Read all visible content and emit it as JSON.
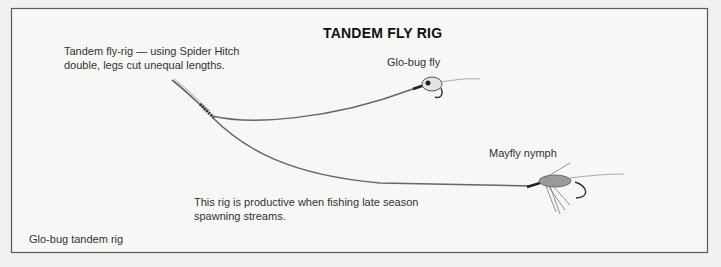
{
  "title": "TANDEM FLY RIG",
  "annotations": {
    "rig_description": [
      "Tandem fly-rig — using Spider Hitch",
      "double, legs cut unequal lengths."
    ],
    "upper_fly_label": "Glo-bug fly",
    "lower_fly_label": "Mayfly nymph",
    "productivity_note": [
      "This rig is productive when fishing late season",
      "spawning streams."
    ],
    "caption": "Glo-bug tandem rig"
  },
  "elements": {
    "knot": "spider-hitch-knot",
    "upper_fly": "glo-bug-fly",
    "lower_fly": "mayfly-nymph-fly"
  }
}
